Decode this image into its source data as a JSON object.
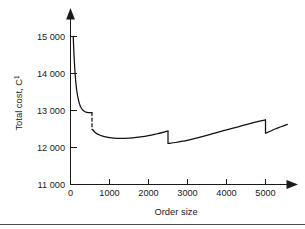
{
  "chart_data": {
    "type": "line",
    "title": "",
    "subtitle": "",
    "xlabel": "Order size",
    "ylabel": "Total cost, C",
    "ylabel_superscript": "1",
    "xlim": [
      0,
      5600
    ],
    "ylim": [
      11000,
      15200
    ],
    "grid": false,
    "legend": null,
    "xticks": [
      0,
      1000,
      2000,
      3000,
      4000,
      5000
    ],
    "xtick_labels": [
      "0",
      "1000",
      "2000",
      "3000",
      "4000",
      "5000"
    ],
    "yticks": [
      11000,
      12000,
      13000,
      14000,
      15000
    ],
    "ytick_labels": [
      "11 000",
      "12 000",
      "13 000",
      "14 000",
      "15 000"
    ],
    "line_color": "#111111",
    "axis_color": "#1a1a1a",
    "annotations": [
      "Discontinuous drop at order size 550",
      "Discontinuous drop at order size 2500",
      "Discontinuous drop at order size 5000"
    ],
    "series": [
      {
        "name": "Segment 1",
        "x": [
          70,
          90,
          110,
          130,
          160,
          200,
          250,
          300,
          360,
          420,
          480,
          550
        ],
        "y": [
          15000,
          14500,
          14120,
          13840,
          13540,
          13300,
          13120,
          13030,
          12975,
          12950,
          12940,
          12945
        ]
      },
      {
        "name": "Segment 2",
        "x": [
          560,
          640,
          760,
          900,
          1050,
          1200,
          1400,
          1600,
          1800,
          2000,
          2200,
          2400,
          2500
        ],
        "y": [
          12490,
          12400,
          12330,
          12285,
          12260,
          12248,
          12245,
          12258,
          12285,
          12320,
          12365,
          12415,
          12445
        ]
      },
      {
        "name": "Segment 3",
        "x": [
          2510,
          2700,
          2900,
          3100,
          3400,
          3700,
          4000,
          4300,
          4600,
          4850,
          5000
        ],
        "y": [
          12110,
          12135,
          12175,
          12220,
          12300,
          12390,
          12475,
          12560,
          12645,
          12710,
          12745
        ]
      },
      {
        "name": "Segment 4",
        "x": [
          5010,
          5120,
          5250,
          5400,
          5560
        ],
        "y": [
          12390,
          12440,
          12500,
          12560,
          12625
        ]
      }
    ]
  },
  "axes": {
    "y_axis_title_text": "Total cost, C",
    "y_axis_title_sup": "1",
    "x_axis_title_text": "Order size"
  }
}
